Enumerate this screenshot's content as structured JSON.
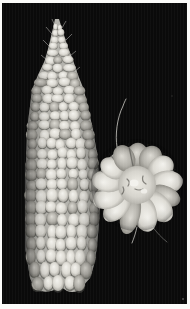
{
  "meta": {
    "description": "A whole ear of corn stands vertically on the left; the round cut butt end of another ear with thin silk strands sits to its right, on a black background inside a thin white photo border."
  },
  "colors": {
    "frame": "#fbfbf9",
    "background": "#0a0a0a",
    "ear_base": "#b4b3ad",
    "kernel_light": "#f4f3ee",
    "kernel_mid": "#dddbd4",
    "kernel_dark": "#8f8d86",
    "kernel_dim": "#b3b1aa",
    "kernel_dim_edge": "#6f6d66",
    "crevice": "#4a4944",
    "rosette_base": "#b0afa9",
    "rosette_center": "#edebe4",
    "silk": "#d8d7d1"
  },
  "figure": {
    "frame_border": {
      "left": 2,
      "top": 3,
      "right": 3,
      "bottom": 5
    },
    "ear": {
      "label": "ear of corn, vertical side view",
      "top": 19,
      "bottom": 287,
      "kernel_col_width": 10.5,
      "profile": [
        [
          20,
          57,
          2
        ],
        [
          30,
          57.5,
          5
        ],
        [
          45,
          58,
          9
        ],
        [
          60,
          59,
          14
        ],
        [
          75,
          58,
          20
        ],
        [
          90,
          58,
          26
        ],
        [
          110,
          59,
          29.5
        ],
        [
          130,
          60,
          33
        ],
        [
          150,
          61.5,
          35
        ],
        [
          170,
          62,
          36.5
        ],
        [
          190,
          62.5,
          37
        ],
        [
          210,
          62.5,
          37
        ],
        [
          230,
          62,
          36.5
        ],
        [
          250,
          61,
          35.5
        ],
        [
          265,
          61,
          33
        ],
        [
          278,
          60,
          30
        ],
        [
          287,
          58,
          24
        ]
      ],
      "tip_hairs": [
        [
          52,
          34,
          46,
          27
        ],
        [
          49,
          46,
          43,
          40
        ],
        [
          55,
          26,
          52,
          19
        ],
        [
          62,
          28,
          66,
          21
        ],
        [
          66,
          40,
          72,
          34
        ],
        [
          70,
          56,
          76,
          51
        ],
        [
          47,
          60,
          41,
          55
        ],
        [
          74,
          72,
          80,
          67
        ]
      ]
    },
    "rosette": {
      "label": "cut end of corn ear, round end view",
      "cx": 137,
      "cy": 185,
      "outer_r": 46,
      "base_r": 39,
      "core_r": 19,
      "lobes": 13,
      "lobe_r": 29.5,
      "lobe_rx": 11,
      "lobe_ry": 16.5
    },
    "silks": [
      {
        "d": "M117,147 C115,135 117,118 123,106 C124,103 125,101 126,99",
        "opacity": 0.95
      },
      {
        "d": "M137,227 C136,232 134,238 132,243",
        "opacity": 0.9
      },
      {
        "d": "M152,226 C157,233 162,238 167,242",
        "opacity": 0.45
      }
    ],
    "specks": [
      {
        "x": 172,
        "y": 96,
        "r": 0.8,
        "opacity": 0.25
      },
      {
        "x": 183,
        "y": 299,
        "r": 1.0,
        "opacity": 0.5
      }
    ]
  }
}
